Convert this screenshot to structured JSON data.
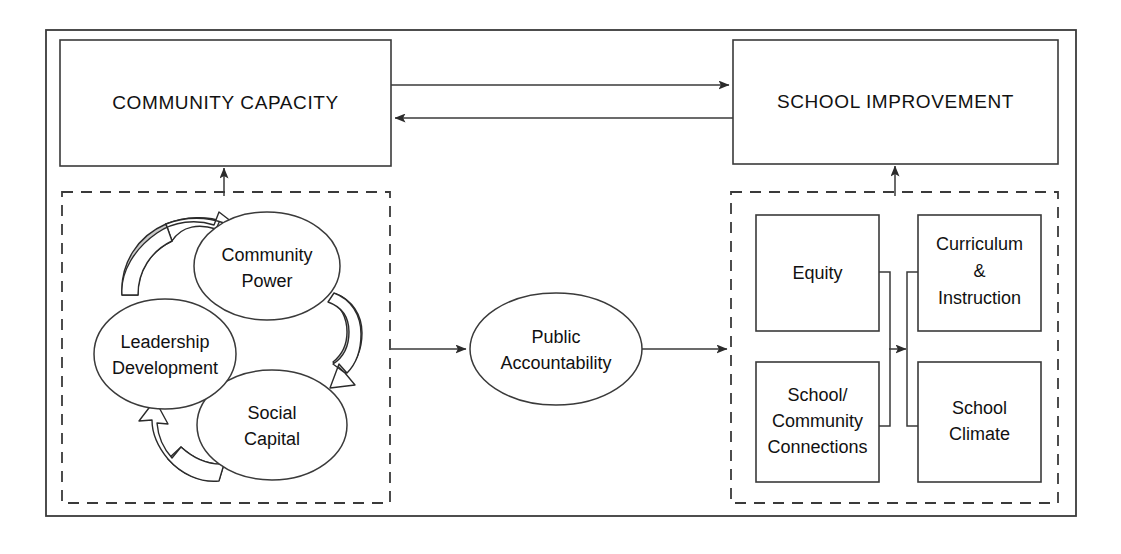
{
  "diagram": {
    "title_top_left": "COMMUNITY CAPACITY",
    "title_top_right": "SCHOOL IMPROVEMENT",
    "center_node": "Public Accountability",
    "cycle_nodes": [
      {
        "id": "community-power",
        "line1": "Community",
        "line2": "Power"
      },
      {
        "id": "social-capital",
        "line1": "Social",
        "line2": "Capital"
      },
      {
        "id": "leadership-development",
        "line1": "Leadership",
        "line2": "Development"
      }
    ],
    "outcome_nodes": [
      {
        "id": "equity",
        "line1": "Equity",
        "line2": "",
        "line3": ""
      },
      {
        "id": "curriculum-instruction",
        "line1": "Curriculum",
        "line2": "&",
        "line3": "Instruction"
      },
      {
        "id": "school-community-connections",
        "line1": "School/",
        "line2": "Community",
        "line3": "Connections"
      },
      {
        "id": "school-climate",
        "line1": "School",
        "line2": "Climate",
        "line3": ""
      }
    ],
    "colors": {
      "stroke": "#3a3a3a",
      "text": "#111111",
      "arrow_shade": "#c9c9c9",
      "background": "#ffffff"
    }
  }
}
